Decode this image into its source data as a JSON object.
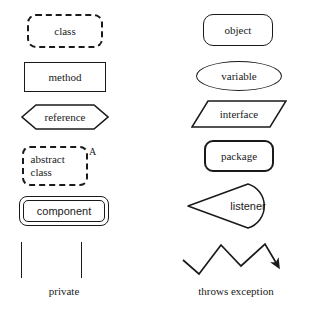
{
  "diagram": {
    "stroke_color": "#1a1a1a",
    "background_color": "#ffffff",
    "left_column": [
      {
        "label": "class",
        "shape": "dashed-rounded-rectangle"
      },
      {
        "label": "method",
        "shape": "rectangle"
      },
      {
        "label": "reference",
        "shape": "hexagon"
      },
      {
        "label_line1": "abstract",
        "label_line2": "class",
        "shape": "dashed-rounded-rectangle",
        "marker": "A"
      },
      {
        "label": "component",
        "shape": "double-rounded-rectangle"
      }
    ],
    "right_column": [
      {
        "label": "object",
        "shape": "rounded-rectangle"
      },
      {
        "label": "variable",
        "shape": "ellipse"
      },
      {
        "label": "interface",
        "shape": "parallelogram"
      },
      {
        "label": "package",
        "shape": "bold-rounded-rectangle"
      },
      {
        "label": "listener",
        "shape": "teardrop"
      }
    ],
    "annotations": {
      "private": {
        "label": "private",
        "shape": "two-vertical-bars"
      },
      "throws_exception": {
        "label": "throws exception",
        "shape": "zigzag-arrow"
      }
    }
  }
}
